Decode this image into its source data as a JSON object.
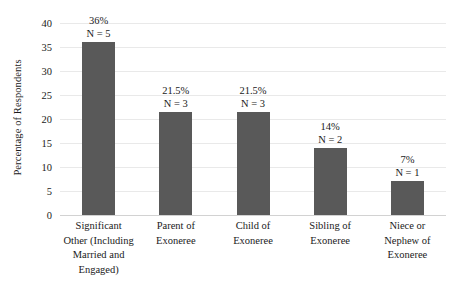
{
  "chart_data": {
    "type": "bar",
    "title": "",
    "xlabel": "",
    "ylabel": "Percentage of Respondents",
    "ylim": [
      0,
      40
    ],
    "ytick_step": 5,
    "grid": true,
    "legend": false,
    "bar_color": "#595959",
    "gridline_color": "#e9e9e9",
    "categories": [
      "Significant Other (Including Married and Engaged)",
      "Parent of Exoneree",
      "Child of Exoneree",
      "Sibling of Exoneree",
      "Niece or Nephew of Exoneree"
    ],
    "category_lines": [
      [
        "Significant",
        "Other (Including",
        "Married and",
        "Engaged)"
      ],
      [
        "Parent of",
        "Exoneree"
      ],
      [
        "Child of",
        "Exoneree"
      ],
      [
        "Sibling of",
        "Exoneree"
      ],
      [
        "Niece or",
        "Nephew of",
        "Exoneree"
      ]
    ],
    "values": [
      36,
      21.5,
      21.5,
      14,
      7
    ],
    "counts": [
      5,
      3,
      3,
      2,
      1
    ],
    "percent_labels": [
      "36%",
      "21.5%",
      "21.5%",
      "14%",
      "7%"
    ],
    "count_labels": [
      "N = 5",
      "N = 3",
      "N = 3",
      "N = 2",
      "N = 1"
    ],
    "ytick_labels": [
      "40",
      "35",
      "30",
      "25",
      "20",
      "15",
      "10",
      "5",
      "0"
    ],
    "ytick_values": [
      40,
      35,
      30,
      25,
      20,
      15,
      10,
      5,
      0
    ]
  }
}
